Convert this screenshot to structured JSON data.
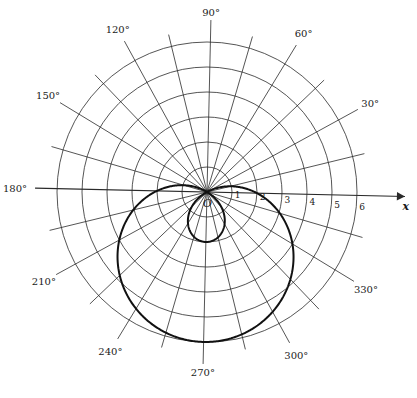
{
  "chart_data": {
    "type": "line",
    "subtype": "polar",
    "title": "",
    "equation": "r = 2 - 4 sin θ",
    "xlabel": "x",
    "origin_label": "O",
    "radial_ticks": [
      "1",
      "2",
      "3",
      "4",
      "5",
      "6"
    ],
    "rlim": [
      0,
      6
    ],
    "angle_labels": [
      "30°",
      "60°",
      "90°",
      "120°",
      "150°",
      "180°",
      "210°",
      "240°",
      "270°",
      "300°",
      "330°"
    ],
    "angle_label_degrees": [
      30,
      60,
      90,
      120,
      150,
      180,
      210,
      240,
      270,
      300,
      330
    ],
    "radial_line_step_deg": 15,
    "grid": true,
    "series": [
      {
        "name": "limaçon",
        "points_theta_deg": [
          0,
          30,
          60,
          90,
          120,
          150,
          180,
          210,
          240,
          270,
          300,
          330,
          360
        ],
        "points_r": [
          2,
          0,
          -1.46,
          -2,
          -1.46,
          0,
          2,
          4,
          5.46,
          6,
          5.46,
          4,
          2
        ]
      }
    ]
  },
  "colors": {
    "grid": "#2a2a2a",
    "curve": "#111111",
    "background": "#ffffff"
  },
  "geometry": {
    "cx": 207,
    "cy": 192,
    "unit_px": 25,
    "radial_line_len": 172,
    "rotation_deg": -1.3
  }
}
